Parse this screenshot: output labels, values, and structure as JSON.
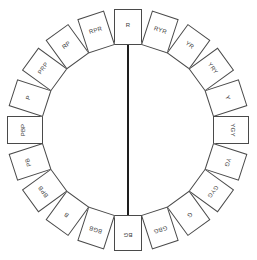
{
  "diagram": {
    "type": "hue-circle",
    "center": [
      128,
      130
    ],
    "segments": [
      {
        "label": "R"
      },
      {
        "label": "RYR"
      },
      {
        "label": "YR"
      },
      {
        "label": "YRY"
      },
      {
        "label": "Y"
      },
      {
        "label": "YGY"
      },
      {
        "label": "YG"
      },
      {
        "label": "GYG"
      },
      {
        "label": "G"
      },
      {
        "label": "GBG"
      },
      {
        "label": "BG"
      },
      {
        "label": "BGB"
      },
      {
        "label": "B"
      },
      {
        "label": "BPB"
      },
      {
        "label": "PB"
      },
      {
        "label": "PBP"
      },
      {
        "label": "P"
      },
      {
        "label": "PRP"
      },
      {
        "label": "RP"
      },
      {
        "label": "RPR"
      }
    ],
    "axis": {
      "from": "R",
      "to": "BG"
    },
    "colors": {
      "stroke": "#4a4a4a",
      "axis": "#1e1e1e",
      "text": "#3a3a3a"
    }
  }
}
